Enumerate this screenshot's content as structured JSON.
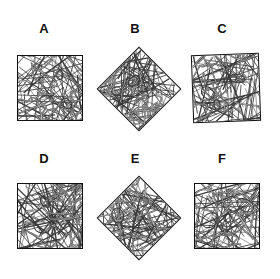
{
  "figure": {
    "title": "",
    "background_color": "#ffffff",
    "stroke_color": "#111111",
    "fiber_color": "#3a3a3a",
    "panel_count": 6,
    "columns": 3,
    "rows": 2,
    "image_type": "fiber network micrograph array"
  },
  "panels": [
    {
      "label": "A",
      "label_x": 44,
      "label_y": 22,
      "shape": "square",
      "rotation_deg": 0,
      "x": 17,
      "y": 55,
      "size": 66,
      "seed": 11,
      "fiber_count": 46,
      "curve_count": 7
    },
    {
      "label": "B",
      "label_x": 135,
      "label_y": 22,
      "shape": "diamond",
      "rotation_deg": 45,
      "x": 109,
      "y": 59,
      "size": 60,
      "seed": 23,
      "fiber_count": 46,
      "curve_count": 8
    },
    {
      "label": "C",
      "label_x": 222,
      "label_y": 22,
      "shape": "square",
      "rotation_deg": -2,
      "x": 192,
      "y": 54,
      "size": 68,
      "seed": 37,
      "fiber_count": 48,
      "curve_count": 7
    },
    {
      "label": "D",
      "label_x": 44,
      "label_y": 152,
      "shape": "square",
      "rotation_deg": 0,
      "x": 17,
      "y": 183,
      "size": 66,
      "seed": 53,
      "fiber_count": 46,
      "curve_count": 7
    },
    {
      "label": "E",
      "label_x": 135,
      "label_y": 152,
      "shape": "diamond",
      "rotation_deg": 45,
      "x": 109,
      "y": 188,
      "size": 60,
      "seed": 67,
      "fiber_count": 48,
      "curve_count": 8
    },
    {
      "label": "F",
      "label_x": 222,
      "label_y": 152,
      "shape": "square",
      "rotation_deg": 0,
      "x": 194,
      "y": 183,
      "size": 66,
      "seed": 83,
      "fiber_count": 46,
      "curve_count": 7
    }
  ]
}
